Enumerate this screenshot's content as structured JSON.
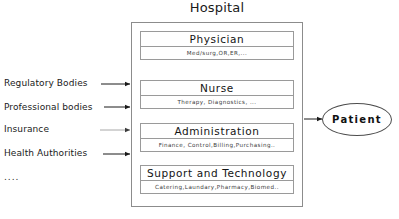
{
  "diagram": {
    "title": "Hospital",
    "type": "block-diagram",
    "departments": [
      {
        "name": "Physician",
        "detail": "Med/surg,OR,ER,..."
      },
      {
        "name": "Nurse",
        "detail": "Therapy, Diagnostics, ..."
      },
      {
        "name": "Administration",
        "detail": "Finance, Control,Billing,Purchasing.."
      },
      {
        "name": "Support and Technology",
        "detail": "Catering,Laundary,Pharmacy,Biomed.."
      }
    ],
    "external_entities": [
      {
        "label": "Regulatory Bodies"
      },
      {
        "label": "Professional bodies"
      },
      {
        "label": "Insurance"
      },
      {
        "label": "Health Authorities"
      },
      {
        "label": "...."
      }
    ],
    "output_node": {
      "label": "Patient",
      "shape": "ellipse"
    },
    "artifact_text": "..",
    "colors": {
      "outer_border": "#8c8c8c",
      "card_border": "#9a9a9a",
      "arrow": "#1a1a1a",
      "arrow_muted": "#a8a8a8",
      "text": "#1a1a1a",
      "background": "#ffffff"
    }
  }
}
